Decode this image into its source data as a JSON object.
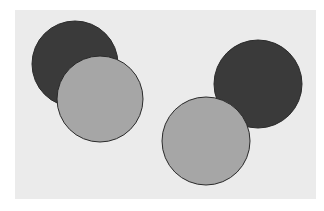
{
  "canvas": {
    "width": 324,
    "height": 211,
    "background": "#ffffff"
  },
  "panel": {
    "x": 15,
    "y": 10,
    "width": 301,
    "height": 189,
    "color": "#ebebeb"
  },
  "colors": {
    "dark": "#3a3a3a",
    "light": "#a6a6a6",
    "stroke": "#2a2a2a"
  },
  "circles": [
    {
      "name": "dark-circle-top-left",
      "cx": 75,
      "cy": 64,
      "r": 43,
      "fill": "dark"
    },
    {
      "name": "light-circle-left",
      "cx": 100,
      "cy": 99,
      "r": 43,
      "fill": "light"
    },
    {
      "name": "dark-circle-right",
      "cx": 258,
      "cy": 84,
      "r": 44,
      "fill": "dark"
    },
    {
      "name": "light-circle-bottom-center",
      "cx": 206,
      "cy": 141,
      "r": 44,
      "fill": "light"
    }
  ]
}
